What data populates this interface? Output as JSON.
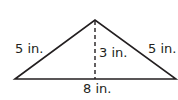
{
  "diagram": {
    "shape": "isosceles triangle",
    "labels": {
      "left_side": "5 in.",
      "right_side": "5 in.",
      "height": "3 in.",
      "base": "8 in."
    },
    "colors": {
      "stroke": "#231f20"
    }
  }
}
